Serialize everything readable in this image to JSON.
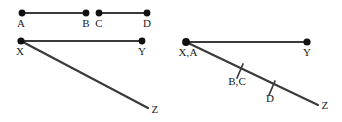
{
  "figure": {
    "background_color": "#ffffff",
    "line_color": "#3a3a3a",
    "dot_color": "#111111",
    "label_color": "#1a1a1a",
    "width": 342,
    "height": 122,
    "diagrams": [
      {
        "id": "left-diagram",
        "name": "separate-segments-diagram",
        "points": [
          {
            "id": "A",
            "label": "A",
            "x": 22,
            "y": 13,
            "has_dot": true,
            "label_x": 21,
            "label_y": 18
          },
          {
            "id": "B",
            "label": "B",
            "x": 86,
            "y": 13,
            "has_dot": true,
            "label_x": 86,
            "label_y": 18
          },
          {
            "id": "C",
            "label": "C",
            "x": 99,
            "y": 13,
            "has_dot": true,
            "label_x": 99,
            "label_y": 18
          },
          {
            "id": "D",
            "label": "D",
            "x": 147,
            "y": 13,
            "has_dot": true,
            "label_x": 147,
            "label_y": 18
          },
          {
            "id": "X",
            "label": "X",
            "x": 21,
            "y": 41,
            "has_dot": true,
            "label_x": 20,
            "label_y": 46
          },
          {
            "id": "Y",
            "label": "Y",
            "x": 142,
            "y": 41,
            "has_dot": true,
            "label_x": 142,
            "label_y": 46
          },
          {
            "id": "Z",
            "label": "Z",
            "x": 148,
            "y": 108,
            "has_dot": false,
            "label_x": 155,
            "label_y": 104
          }
        ],
        "segments": [
          {
            "id": "AB",
            "name": "segment-ab",
            "from": "A",
            "to": "B"
          },
          {
            "id": "CD",
            "name": "segment-cd",
            "from": "C",
            "to": "D"
          },
          {
            "id": "XY",
            "name": "segment-xy",
            "from": "X",
            "to": "Y"
          },
          {
            "id": "XZ",
            "name": "segment-xz",
            "from": "X",
            "to": "Z"
          }
        ],
        "ticks": []
      },
      {
        "id": "right-diagram",
        "name": "merged-segments-diagram",
        "points": [
          {
            "id": "XA",
            "label": "X,A",
            "x": 186,
            "y": 42,
            "has_dot": true,
            "label_x": 188,
            "label_y": 47
          },
          {
            "id": "Y",
            "label": "Y",
            "x": 307,
            "y": 42,
            "has_dot": true,
            "label_x": 307,
            "label_y": 47
          },
          {
            "id": "Z",
            "label": "Z",
            "x": 318,
            "y": 105,
            "has_dot": false,
            "label_x": 325,
            "label_y": 100
          }
        ],
        "segments": [
          {
            "id": "XAY",
            "name": "segment-xa-y",
            "from": "XA",
            "to": "Y"
          },
          {
            "id": "XAZ",
            "name": "segment-xa-z",
            "from": "XA",
            "to": "Z"
          }
        ],
        "ticks": [
          {
            "id": "BC",
            "label": "B,C",
            "x": 240,
            "y": 71,
            "label_x": 237,
            "label_y": 76,
            "angle": 62
          },
          {
            "id": "D",
            "label": "D",
            "x": 272,
            "y": 88,
            "label_x": 270,
            "label_y": 93,
            "angle": 62
          }
        ]
      }
    ]
  }
}
